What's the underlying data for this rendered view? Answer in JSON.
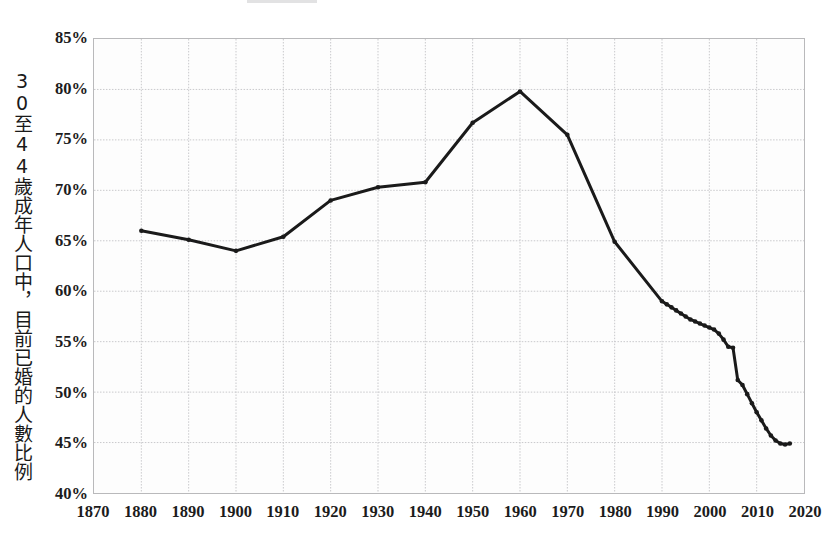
{
  "chart_data": {
    "type": "line",
    "title": "",
    "xlabel": "",
    "ylabel": "30至44歲成年人口中，目前已婚的人數比例",
    "xlim": [
      1870,
      2020
    ],
    "ylim": [
      40,
      85
    ],
    "ytick_labels": [
      "85%",
      "80%",
      "75%",
      "70%",
      "65%",
      "60%",
      "55%",
      "50%",
      "45%",
      "40%"
    ],
    "ytick_values": [
      85,
      80,
      75,
      70,
      65,
      60,
      55,
      50,
      45,
      40
    ],
    "xtick_labels": [
      "1870",
      "1880",
      "1890",
      "1900",
      "1910",
      "1920",
      "1930",
      "1940",
      "1950",
      "1960",
      "1970",
      "1980",
      "1990",
      "2000",
      "2010",
      "2020"
    ],
    "xtick_values": [
      1870,
      1880,
      1890,
      1900,
      1910,
      1920,
      1930,
      1940,
      1950,
      1960,
      1970,
      1980,
      1990,
      2000,
      2010,
      2020
    ],
    "grid": true,
    "legend": false,
    "line_color": "#1a1a1a",
    "line_width": 3,
    "marker": "dot",
    "series": [
      {
        "name": "married-share",
        "x": [
          1880,
          1890,
          1900,
          1910,
          1920,
          1930,
          1940,
          1950,
          1960,
          1970,
          1980,
          1990,
          1991,
          1992,
          1993,
          1994,
          1995,
          1996,
          1997,
          1998,
          1999,
          2000,
          2001,
          2002,
          2003,
          2004,
          2005,
          2006,
          2007,
          2008,
          2009,
          2010,
          2011,
          2012,
          2013,
          2014,
          2015,
          2016,
          2017
        ],
        "values": [
          66.0,
          65.1,
          64.0,
          65.4,
          69.0,
          70.3,
          70.8,
          76.7,
          79.8,
          75.5,
          64.9,
          59.0,
          58.7,
          58.4,
          58.1,
          57.8,
          57.5,
          57.2,
          57.0,
          56.8,
          56.6,
          56.4,
          56.2,
          55.8,
          55.2,
          54.5,
          54.4,
          51.2,
          50.7,
          49.8,
          48.9,
          48.0,
          47.2,
          46.4,
          45.7,
          45.2,
          44.9,
          44.8,
          44.9
        ]
      }
    ]
  },
  "axis": {
    "y_title": "30至44歲成年人口中，目前已婚的人數比例"
  }
}
